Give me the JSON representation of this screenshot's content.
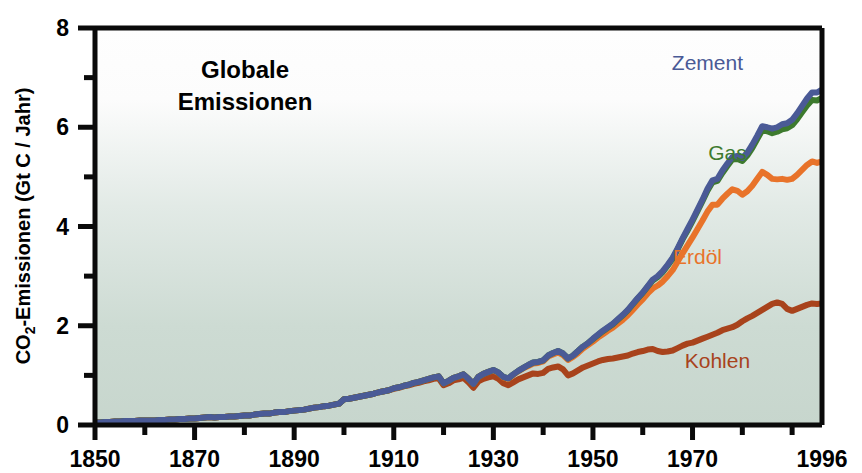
{
  "chart_data": {
    "type": "area",
    "title": "Globale Emissionen",
    "title_lines": [
      "Globale",
      "Emissionen"
    ],
    "xlabel": "",
    "ylabel": "CO2-Emissionen (Gt C / Jahr)",
    "ylabel_parts": {
      "pre": "CO",
      "sub": "2",
      "post": "-Emissionen (Gt C / Jahr)"
    },
    "xlim": [
      1850,
      1996
    ],
    "ylim": [
      0,
      8
    ],
    "y_ticks_major": [
      0,
      2,
      4,
      6,
      8
    ],
    "y_ticks_minor": [
      1,
      3,
      5,
      7
    ],
    "y_tick_labels": [
      "0",
      "2",
      "4",
      "6",
      "8"
    ],
    "x_ticks_major": [
      1850,
      1870,
      1890,
      1910,
      1930,
      1950,
      1970,
      1996
    ],
    "x_tick_labels": [
      "1850",
      "1870",
      "1890",
      "1910",
      "1930",
      "1950",
      "1970",
      "1996"
    ],
    "x_ticks_minor": [
      1860,
      1880,
      1900,
      1920,
      1940,
      1960,
      1980,
      1990
    ],
    "grid": false,
    "legend_position": "inline-right",
    "stacked": true,
    "plot_background_gradient": [
      "#fdfdfd",
      "#c9d8d0"
    ],
    "series": [
      {
        "name": "Kohlen",
        "color": "#a8431c",
        "label_x": 1975,
        "label_y": 1.15,
        "values": [
          0.05,
          0.05,
          0.06,
          0.06,
          0.07,
          0.07,
          0.08,
          0.08,
          0.08,
          0.09,
          0.09,
          0.09,
          0.09,
          0.1,
          0.1,
          0.11,
          0.11,
          0.12,
          0.12,
          0.13,
          0.13,
          0.14,
          0.15,
          0.16,
          0.15,
          0.16,
          0.16,
          0.17,
          0.17,
          0.18,
          0.19,
          0.19,
          0.21,
          0.22,
          0.23,
          0.23,
          0.25,
          0.26,
          0.26,
          0.28,
          0.29,
          0.3,
          0.31,
          0.33,
          0.35,
          0.36,
          0.38,
          0.39,
          0.41,
          0.43,
          0.52,
          0.53,
          0.55,
          0.57,
          0.59,
          0.61,
          0.63,
          0.66,
          0.68,
          0.7,
          0.73,
          0.75,
          0.78,
          0.8,
          0.83,
          0.85,
          0.88,
          0.9,
          0.93,
          0.94,
          0.8,
          0.84,
          0.9,
          0.92,
          0.95,
          0.86,
          0.75,
          0.88,
          0.93,
          0.96,
          0.98,
          0.93,
          0.84,
          0.8,
          0.86,
          0.92,
          0.96,
          1.0,
          1.04,
          1.03,
          1.05,
          1.13,
          1.16,
          1.18,
          1.12,
          1.0,
          1.04,
          1.1,
          1.16,
          1.2,
          1.24,
          1.28,
          1.31,
          1.33,
          1.34,
          1.36,
          1.38,
          1.4,
          1.44,
          1.47,
          1.49,
          1.52,
          1.53,
          1.49,
          1.47,
          1.48,
          1.5,
          1.55,
          1.6,
          1.64,
          1.66,
          1.7,
          1.74,
          1.78,
          1.82,
          1.86,
          1.91,
          1.94,
          1.97,
          2.02,
          2.09,
          2.15,
          2.2,
          2.26,
          2.32,
          2.38,
          2.44,
          2.47,
          2.44,
          2.34,
          2.3,
          2.34,
          2.38,
          2.42,
          2.45,
          2.44,
          2.45
        ]
      },
      {
        "name": "Erdöl",
        "color": "#e8732a",
        "label_x": 1971,
        "label_y": 3.25,
        "values": [
          0.0,
          0.0,
          0.0,
          0.0,
          0.0,
          0.0,
          0.0,
          0.0,
          0.0,
          0.0,
          0.0,
          0.0,
          0.0,
          0.0,
          0.0,
          0.0,
          0.0,
          0.0,
          0.0,
          0.0,
          0.0,
          0.0,
          0.0,
          0.0,
          0.0,
          0.0,
          0.0,
          0.0,
          0.0,
          0.0,
          0.0,
          0.0,
          0.0,
          0.0,
          0.0,
          0.0,
          0.0,
          0.0,
          0.0,
          0.0,
          0.0,
          0.0,
          0.0,
          0.0,
          0.0,
          0.0,
          0.0,
          0.0,
          0.0,
          0.0,
          0.0,
          0.0,
          0.0,
          0.0,
          0.0,
          0.0,
          0.0,
          0.0,
          0.0,
          0.0,
          0.01,
          0.01,
          0.01,
          0.01,
          0.02,
          0.02,
          0.02,
          0.03,
          0.03,
          0.04,
          0.04,
          0.05,
          0.05,
          0.06,
          0.07,
          0.07,
          0.08,
          0.09,
          0.1,
          0.11,
          0.12,
          0.12,
          0.12,
          0.13,
          0.15,
          0.16,
          0.18,
          0.19,
          0.2,
          0.22,
          0.23,
          0.25,
          0.26,
          0.28,
          0.29,
          0.31,
          0.33,
          0.35,
          0.38,
          0.41,
          0.44,
          0.48,
          0.52,
          0.57,
          0.62,
          0.68,
          0.74,
          0.81,
          0.88,
          0.96,
          1.04,
          1.13,
          1.22,
          1.32,
          1.42,
          1.52,
          1.62,
          1.74,
          1.86,
          1.98,
          2.12,
          2.25,
          2.38,
          2.52,
          2.62,
          2.58,
          2.65,
          2.72,
          2.78,
          2.7,
          2.55,
          2.56,
          2.62,
          2.7,
          2.78,
          2.66,
          2.52,
          2.48,
          2.52,
          2.6,
          2.66,
          2.7,
          2.76,
          2.82,
          2.86,
          2.84,
          2.86
        ]
      },
      {
        "name": "Gas",
        "color": "#3d7a2e",
        "label_x": 1977,
        "label_y": 5.35,
        "values": [
          0.0,
          0.0,
          0.0,
          0.0,
          0.0,
          0.0,
          0.0,
          0.0,
          0.0,
          0.0,
          0.0,
          0.0,
          0.0,
          0.0,
          0.0,
          0.0,
          0.0,
          0.0,
          0.0,
          0.0,
          0.0,
          0.0,
          0.0,
          0.0,
          0.0,
          0.0,
          0.0,
          0.0,
          0.0,
          0.0,
          0.0,
          0.0,
          0.0,
          0.0,
          0.0,
          0.0,
          0.0,
          0.0,
          0.0,
          0.0,
          0.0,
          0.0,
          0.0,
          0.0,
          0.0,
          0.0,
          0.0,
          0.0,
          0.0,
          0.0,
          0.0,
          0.0,
          0.0,
          0.0,
          0.0,
          0.0,
          0.0,
          0.0,
          0.0,
          0.0,
          0.0,
          0.0,
          0.0,
          0.0,
          0.0,
          0.0,
          0.0,
          0.0,
          0.0,
          0.0,
          0.0,
          0.0,
          0.0,
          0.0,
          0.0,
          0.0,
          0.0,
          0.0,
          0.0,
          0.0,
          0.01,
          0.01,
          0.01,
          0.01,
          0.01,
          0.01,
          0.01,
          0.02,
          0.02,
          0.02,
          0.02,
          0.02,
          0.03,
          0.03,
          0.03,
          0.03,
          0.03,
          0.04,
          0.04,
          0.04,
          0.05,
          0.05,
          0.06,
          0.06,
          0.07,
          0.08,
          0.09,
          0.1,
          0.11,
          0.12,
          0.13,
          0.14,
          0.16,
          0.17,
          0.19,
          0.21,
          0.23,
          0.25,
          0.28,
          0.3,
          0.33,
          0.36,
          0.39,
          0.42,
          0.45,
          0.48,
          0.52,
          0.56,
          0.6,
          0.64,
          0.68,
          0.72,
          0.76,
          0.8,
          0.84,
          0.88,
          0.92,
          0.96,
          1.0,
          1.04,
          1.08,
          1.12,
          1.16,
          1.2,
          1.24,
          1.26,
          1.28
        ]
      },
      {
        "name": "Zement",
        "color": "#4a5a96",
        "label_x": 1973,
        "label_y": 7.15,
        "values": [
          0.0,
          0.0,
          0.0,
          0.0,
          0.0,
          0.0,
          0.0,
          0.0,
          0.0,
          0.0,
          0.0,
          0.0,
          0.0,
          0.0,
          0.0,
          0.0,
          0.0,
          0.0,
          0.0,
          0.0,
          0.0,
          0.0,
          0.0,
          0.0,
          0.0,
          0.0,
          0.0,
          0.0,
          0.0,
          0.0,
          0.0,
          0.0,
          0.0,
          0.0,
          0.0,
          0.0,
          0.0,
          0.0,
          0.0,
          0.0,
          0.0,
          0.0,
          0.0,
          0.0,
          0.0,
          0.0,
          0.0,
          0.0,
          0.0,
          0.0,
          0.0,
          0.0,
          0.0,
          0.0,
          0.0,
          0.0,
          0.0,
          0.0,
          0.0,
          0.0,
          0.0,
          0.0,
          0.0,
          0.0,
          0.0,
          0.0,
          0.0,
          0.0,
          0.0,
          0.0,
          0.0,
          0.0,
          0.0,
          0.0,
          0.0,
          0.0,
          0.0,
          0.0,
          0.0,
          0.0,
          0.0,
          0.0,
          0.0,
          0.0,
          0.0,
          0.0,
          0.0,
          0.0,
          0.0,
          0.0,
          0.0,
          0.0,
          0.0,
          0.0,
          0.0,
          0.0,
          0.0,
          0.0,
          0.0,
          0.0,
          0.01,
          0.01,
          0.01,
          0.01,
          0.01,
          0.01,
          0.01,
          0.01,
          0.01,
          0.01,
          0.01,
          0.01,
          0.02,
          0.02,
          0.02,
          0.02,
          0.02,
          0.02,
          0.02,
          0.03,
          0.03,
          0.03,
          0.03,
          0.04,
          0.04,
          0.04,
          0.05,
          0.05,
          0.05,
          0.06,
          0.06,
          0.06,
          0.07,
          0.07,
          0.08,
          0.08,
          0.09,
          0.09,
          0.1,
          0.1,
          0.11,
          0.12,
          0.13,
          0.14,
          0.15,
          0.16,
          0.17
        ]
      }
    ],
    "stack_totals_note": "Kohlen + Erdöl + Gas + Zement"
  }
}
